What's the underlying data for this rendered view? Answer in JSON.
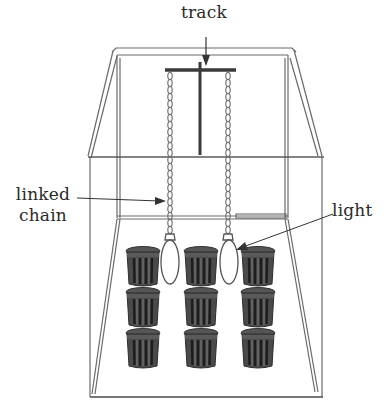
{
  "diagram": {
    "labels": {
      "track": "track",
      "linked_chain_line1": "linked",
      "linked_chain_line2": "chain",
      "light": "light"
    },
    "colors": {
      "line": "#6a6a6a",
      "dark_line": "#3a3a3a",
      "pot_fill": "#4a4a4a",
      "pot_stripe": "#222222",
      "text": "#2a2a2a",
      "background": "#ffffff"
    },
    "components": {
      "frame": "enclosure",
      "track": "overhead track",
      "chains": 2,
      "lights": 2,
      "pots": {
        "rows": 3,
        "columns": 3,
        "count": 9
      }
    }
  }
}
